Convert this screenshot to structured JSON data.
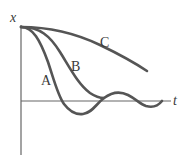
{
  "diagram": {
    "type": "damped-oscillation-graph",
    "axes": {
      "vertical_label": "x",
      "horizontal_label": "t"
    },
    "curves": [
      {
        "id": "A",
        "label": "A",
        "description": "underdamped — oscillates about t-axis with decaying amplitude"
      },
      {
        "id": "B",
        "label": "B",
        "description": "critically damped — approaches t-axis fastest without oscillating"
      },
      {
        "id": "C",
        "label": "C",
        "description": "overdamped — decays slowly"
      }
    ],
    "colors": {
      "curve": "#555555",
      "axis": "#666666",
      "text": "#3a3a3a"
    }
  }
}
